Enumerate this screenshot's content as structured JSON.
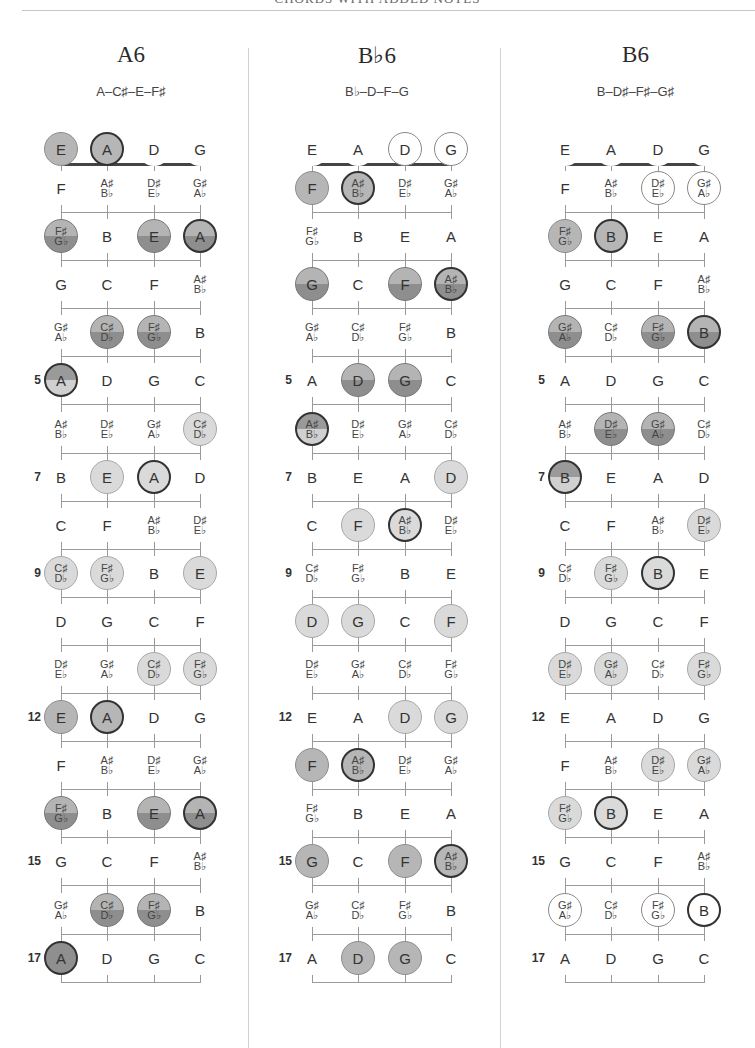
{
  "header": {
    "title": "CHORDS WITH ADDED NOTES"
  },
  "colors": {
    "mid": "#b6b6b6",
    "dark": "#8f8f8f",
    "light": "#dadada",
    "root_border": "#333333",
    "line": "#9a9a9a"
  },
  "strings": [
    "E",
    "A",
    "D",
    "G"
  ],
  "fret_markers": [
    5,
    7,
    9,
    12,
    15,
    17
  ],
  "fret_notes": {
    "0": [
      "E",
      "A",
      "D",
      "G"
    ],
    "1": [
      "F",
      "A♯/B♭",
      "D♯/E♭",
      "G♯/A♭"
    ],
    "2": [
      "F♯/G♭",
      "B",
      "E",
      "A"
    ],
    "3": [
      "G",
      "C",
      "F",
      "A♯/B♭"
    ],
    "4": [
      "G♯/A♭",
      "C♯/D♭",
      "F♯/G♭",
      "B"
    ],
    "5": [
      "A",
      "D",
      "G",
      "C"
    ],
    "6": [
      "A♯/B♭",
      "D♯/E♭",
      "G♯/A♭",
      "C♯/D♭"
    ],
    "7": [
      "B",
      "E",
      "A",
      "D"
    ],
    "8": [
      "C",
      "F",
      "A♯/B♭",
      "D♯/E♭"
    ],
    "9": [
      "C♯/D♭",
      "F♯/G♭",
      "B",
      "E"
    ],
    "10": [
      "D",
      "G",
      "C",
      "F"
    ],
    "11": [
      "D♯/E♭",
      "G♯/A♭",
      "C♯/D♭",
      "F♯/G♭"
    ],
    "12": [
      "E",
      "A",
      "D",
      "G"
    ],
    "13": [
      "F",
      "A♯/B♭",
      "D♯/E♭",
      "G♯/A♭"
    ],
    "14": [
      "F♯/G♭",
      "B",
      "E",
      "A"
    ],
    "15": [
      "G",
      "C",
      "F",
      "A♯/B♭"
    ],
    "16": [
      "G♯/A♭",
      "C♯/D♭",
      "F♯/G♭",
      "B"
    ],
    "17": [
      "A",
      "D",
      "G",
      "C"
    ]
  },
  "charts": [
    {
      "name": "A6",
      "notes": "A–C♯–E–F♯",
      "marked": [
        {
          "fret": 0,
          "string": 0,
          "style": "mid"
        },
        {
          "fret": 0,
          "string": 1,
          "style": "mid",
          "root": true
        },
        {
          "fret": 2,
          "string": 0,
          "style": "split"
        },
        {
          "fret": 2,
          "string": 2,
          "style": "split"
        },
        {
          "fret": 2,
          "string": 3,
          "style": "split",
          "root": true
        },
        {
          "fret": 4,
          "string": 1,
          "style": "split"
        },
        {
          "fret": 4,
          "string": 2,
          "style": "split"
        },
        {
          "fret": 5,
          "string": 0,
          "style": "split-light",
          "root": true
        },
        {
          "fret": 6,
          "string": 3,
          "style": "light"
        },
        {
          "fret": 7,
          "string": 1,
          "style": "light"
        },
        {
          "fret": 7,
          "string": 2,
          "style": "light",
          "root": true
        },
        {
          "fret": 9,
          "string": 0,
          "style": "light"
        },
        {
          "fret": 9,
          "string": 1,
          "style": "light"
        },
        {
          "fret": 9,
          "string": 3,
          "style": "light"
        },
        {
          "fret": 11,
          "string": 2,
          "style": "light"
        },
        {
          "fret": 11,
          "string": 3,
          "style": "light"
        },
        {
          "fret": 12,
          "string": 0,
          "style": "mid"
        },
        {
          "fret": 12,
          "string": 1,
          "style": "mid",
          "root": true
        },
        {
          "fret": 14,
          "string": 0,
          "style": "split"
        },
        {
          "fret": 14,
          "string": 2,
          "style": "split"
        },
        {
          "fret": 14,
          "string": 3,
          "style": "split",
          "root": true
        },
        {
          "fret": 16,
          "string": 1,
          "style": "split"
        },
        {
          "fret": 16,
          "string": 2,
          "style": "split"
        },
        {
          "fret": 17,
          "string": 0,
          "style": "dark",
          "root": true
        }
      ]
    },
    {
      "name": "B♭6",
      "notes": "B♭–D–F–G",
      "marked": [
        {
          "fret": 0,
          "string": 2,
          "style": "open"
        },
        {
          "fret": 0,
          "string": 3,
          "style": "open"
        },
        {
          "fret": 1,
          "string": 0,
          "style": "mid"
        },
        {
          "fret": 1,
          "string": 1,
          "style": "mid",
          "root": true
        },
        {
          "fret": 3,
          "string": 0,
          "style": "split"
        },
        {
          "fret": 3,
          "string": 2,
          "style": "split"
        },
        {
          "fret": 3,
          "string": 3,
          "style": "split",
          "root": true
        },
        {
          "fret": 5,
          "string": 1,
          "style": "split"
        },
        {
          "fret": 5,
          "string": 2,
          "style": "split"
        },
        {
          "fret": 6,
          "string": 0,
          "style": "split-light",
          "root": true
        },
        {
          "fret": 7,
          "string": 3,
          "style": "light"
        },
        {
          "fret": 8,
          "string": 1,
          "style": "light"
        },
        {
          "fret": 8,
          "string": 2,
          "style": "light",
          "root": true
        },
        {
          "fret": 10,
          "string": 0,
          "style": "light"
        },
        {
          "fret": 10,
          "string": 1,
          "style": "light"
        },
        {
          "fret": 10,
          "string": 3,
          "style": "light"
        },
        {
          "fret": 12,
          "string": 2,
          "style": "light"
        },
        {
          "fret": 12,
          "string": 3,
          "style": "light"
        },
        {
          "fret": 13,
          "string": 0,
          "style": "mid"
        },
        {
          "fret": 13,
          "string": 1,
          "style": "mid",
          "root": true
        },
        {
          "fret": 15,
          "string": 0,
          "style": "mid"
        },
        {
          "fret": 15,
          "string": 2,
          "style": "mid"
        },
        {
          "fret": 15,
          "string": 3,
          "style": "mid",
          "root": true
        },
        {
          "fret": 17,
          "string": 1,
          "style": "mid"
        },
        {
          "fret": 17,
          "string": 2,
          "style": "mid"
        }
      ]
    },
    {
      "name": "B6",
      "notes": "B–D♯–F♯–G♯",
      "marked": [
        {
          "fret": 1,
          "string": 2,
          "style": "open"
        },
        {
          "fret": 1,
          "string": 3,
          "style": "open"
        },
        {
          "fret": 2,
          "string": 0,
          "style": "mid"
        },
        {
          "fret": 2,
          "string": 1,
          "style": "mid",
          "root": true
        },
        {
          "fret": 4,
          "string": 0,
          "style": "split"
        },
        {
          "fret": 4,
          "string": 2,
          "style": "split"
        },
        {
          "fret": 4,
          "string": 3,
          "style": "split",
          "root": true
        },
        {
          "fret": 6,
          "string": 1,
          "style": "split"
        },
        {
          "fret": 6,
          "string": 2,
          "style": "split"
        },
        {
          "fret": 7,
          "string": 0,
          "style": "split-light",
          "root": true
        },
        {
          "fret": 8,
          "string": 3,
          "style": "light"
        },
        {
          "fret": 9,
          "string": 1,
          "style": "light"
        },
        {
          "fret": 9,
          "string": 2,
          "style": "light",
          "root": true
        },
        {
          "fret": 11,
          "string": 0,
          "style": "light"
        },
        {
          "fret": 11,
          "string": 1,
          "style": "light"
        },
        {
          "fret": 11,
          "string": 3,
          "style": "light"
        },
        {
          "fret": 13,
          "string": 2,
          "style": "light"
        },
        {
          "fret": 13,
          "string": 3,
          "style": "light"
        },
        {
          "fret": 14,
          "string": 0,
          "style": "light"
        },
        {
          "fret": 14,
          "string": 1,
          "style": "light",
          "root": true
        },
        {
          "fret": 16,
          "string": 0,
          "style": "open"
        },
        {
          "fret": 16,
          "string": 2,
          "style": "open"
        },
        {
          "fret": 16,
          "string": 3,
          "style": "open",
          "root": true
        }
      ]
    }
  ]
}
